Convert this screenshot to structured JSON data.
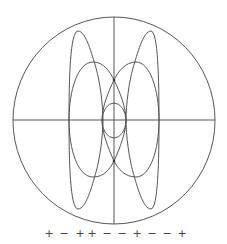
{
  "figure": {
    "stroke_color": "#555555",
    "background": "#ffffff",
    "circle": {
      "cx": 114,
      "cy": 120,
      "r": 102
    },
    "axes": {
      "horizontal_y": 120,
      "vertical_x": 114
    }
  },
  "signs": {
    "sequence": [
      "+",
      "−",
      "+",
      "+",
      "−",
      "−",
      "+",
      "−",
      "−",
      "+"
    ],
    "s0": "+",
    "s1": "−",
    "s2": "+",
    "s3": "+",
    "s4": "−",
    "s5": "−",
    "s6": "+",
    "s7": "−",
    "s8": "−",
    "s9": "+"
  }
}
